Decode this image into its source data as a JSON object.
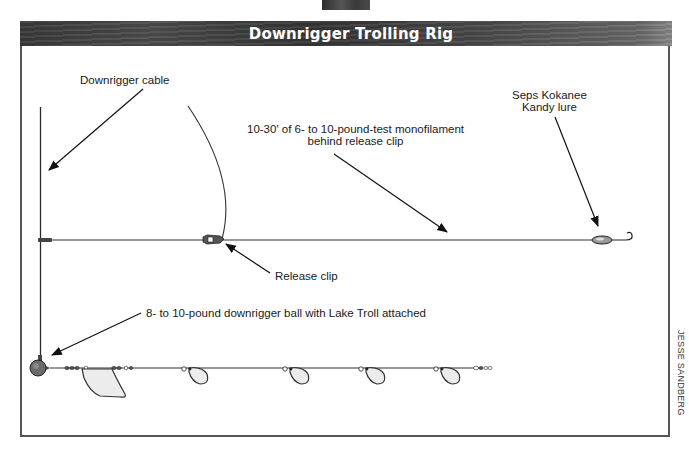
{
  "header": {
    "title": "Downrigger Trolling Rig"
  },
  "labels": {
    "downrigger_cable": "Downrigger cable",
    "monofilament_line1": "10-30' of 6- to 10-pound-test monofilament",
    "monofilament_line2": "behind release clip",
    "lure_line1": "Seps Kokanee",
    "lure_line2": "Kandy lure",
    "release_clip": "Release clip",
    "downrigger_ball": "8- to 10-pound downrigger ball with Lake Troll attached"
  },
  "credit": "JESSE SANDBERG",
  "colors": {
    "line": "#2a2a2a",
    "frame": "#555555",
    "blade_fill": "#ececec",
    "ball_fill": "#6a6a6a"
  }
}
